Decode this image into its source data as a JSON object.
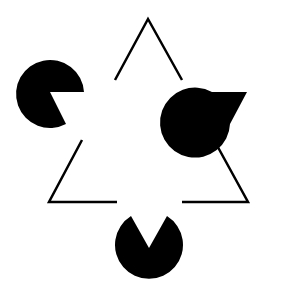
{
  "figure": {
    "width": 294,
    "height": 296,
    "background": "#ffffff",
    "ink": "#000000",
    "inducers": [
      {
        "name": "pacman-top-left",
        "cx": 50,
        "cy": 92,
        "r": 34,
        "mouth": [
          [
            84,
            92
          ],
          [
            66,
            124
          ]
        ]
      },
      {
        "name": "pacman-top-right",
        "cx": 247,
        "cy": 92,
        "r": 35,
        "mouth": [
          [
            212,
            92
          ],
          [
            230,
            124
          ]
        ]
      },
      {
        "name": "pacman-bottom",
        "cx": 149,
        "cy": 248,
        "r": 34,
        "mouth": [
          [
            131,
            216
          ],
          [
            167,
            216
          ]
        ]
      }
    ],
    "outline_triangle": {
      "stroke_width": 2.5,
      "segments": [
        [
          [
            115,
            80
          ],
          [
            148,
            19
          ],
          [
            182,
            80
          ]
        ],
        [
          [
            82,
            140
          ],
          [
            49,
            202
          ],
          [
            117,
            202
          ]
        ],
        [
          [
            214,
            140
          ],
          [
            248,
            202
          ],
          [
            182,
            202
          ]
        ]
      ]
    }
  }
}
